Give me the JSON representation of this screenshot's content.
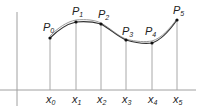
{
  "diagram": {
    "title": "",
    "points": [
      {
        "label": "P",
        "sub": "0",
        "x": 50,
        "y": 38
      },
      {
        "label": "P",
        "sub": "1",
        "x": 76,
        "y": 22
      },
      {
        "label": "P",
        "sub": "2",
        "x": 101,
        "y": 24
      },
      {
        "label": "P",
        "sub": "3",
        "x": 126,
        "y": 40
      },
      {
        "label": "P",
        "sub": "4",
        "x": 152,
        "y": 43
      },
      {
        "label": "P",
        "sub": "5",
        "x": 177,
        "y": 20
      }
    ],
    "x_labels": [
      {
        "label": "x",
        "sub": "0"
      },
      {
        "label": "x",
        "sub": "1"
      },
      {
        "label": "x",
        "sub": "2"
      },
      {
        "label": "x",
        "sub": "3"
      },
      {
        "label": "x",
        "sub": "4"
      },
      {
        "label": "x",
        "sub": "5"
      }
    ],
    "colors": {
      "axis": "#9a9a9a",
      "curve": "#333333",
      "point": "#111111",
      "text": "#222222"
    }
  }
}
